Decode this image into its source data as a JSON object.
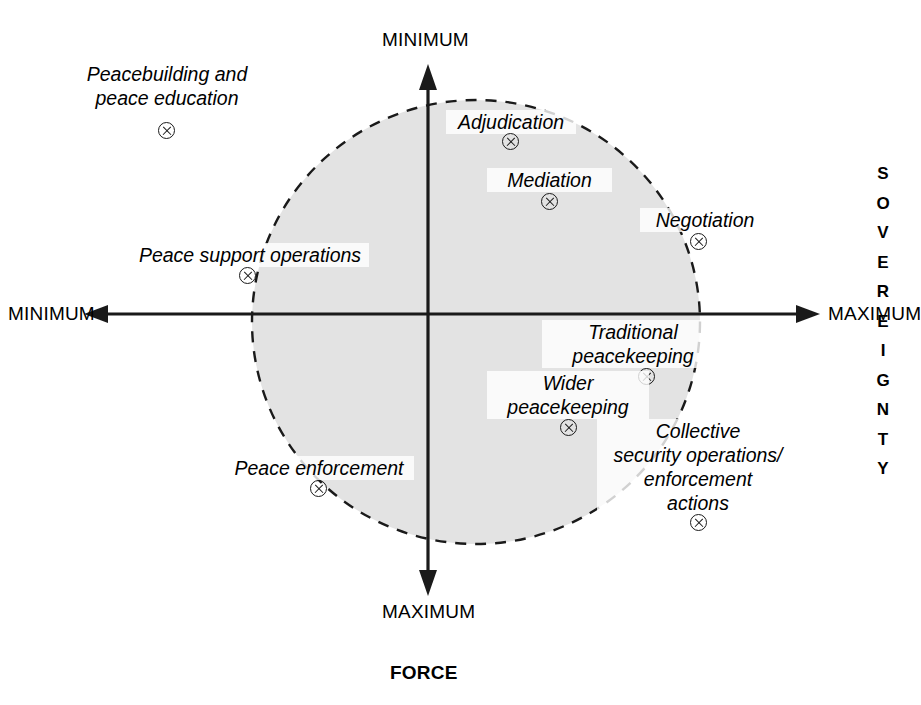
{
  "figure": {
    "type": "quadrant-diagram",
    "background_color": "#ffffff",
    "shaded_region_color": "#e3e3e3",
    "line_color": "#1a1a1a"
  },
  "axes": {
    "horizontal": {
      "name": "FORCE",
      "title": "FORCE",
      "left_label": "MINIMUM",
      "right_label": "MAXIMUM"
    },
    "vertical": {
      "name": "SOVEREIGNTY",
      "title": "SOVEREIGNTY",
      "title_letters": [
        "S",
        "O",
        "V",
        "E",
        "R",
        "E",
        "I",
        "G",
        "N",
        "T",
        "Y"
      ],
      "top_label": "MINIMUM",
      "bottom_label": "MAXIMUM"
    }
  },
  "items": [
    {
      "id": "peacebuilding",
      "label": "Peacebuilding and\npeace education",
      "marker": "circled-x",
      "inside_region": false,
      "force": "low",
      "sovereignty": "very-low"
    },
    {
      "id": "adjudication",
      "label": "Adjudication",
      "marker": "circled-x",
      "inside_region": true,
      "force": "medium-low",
      "sovereignty": "low"
    },
    {
      "id": "mediation",
      "label": "Mediation",
      "marker": "circled-x",
      "inside_region": true,
      "force": "medium",
      "sovereignty": "low-medium"
    },
    {
      "id": "negotiation",
      "label": "Negotiation",
      "marker": "circled-x",
      "inside_region": true,
      "force": "high",
      "sovereignty": "medium-low"
    },
    {
      "id": "peace-support-operations",
      "label": "Peace support operations",
      "marker": "circled-x",
      "inside_region": false,
      "force": "very-low",
      "sovereignty": "medium-low"
    },
    {
      "id": "traditional-peacekeeping",
      "label": "Traditional\npeacekeeping",
      "marker": "circled-x",
      "inside_region": true,
      "force": "high",
      "sovereignty": "medium-high"
    },
    {
      "id": "wider-peacekeeping",
      "label": "Wider\npeacekeeping",
      "marker": "circled-x",
      "inside_region": true,
      "force": "medium-high",
      "sovereignty": "high"
    },
    {
      "id": "collective-security",
      "label": "Collective\nsecurity operations/\nenforcement\nactions",
      "marker": "circled-x",
      "inside_region": false,
      "force": "very-high",
      "sovereignty": "very-high"
    },
    {
      "id": "peace-enforcement",
      "label": "Peace enforcement",
      "marker": "circled-x",
      "inside_region": true,
      "force": "low",
      "sovereignty": "high"
    }
  ]
}
